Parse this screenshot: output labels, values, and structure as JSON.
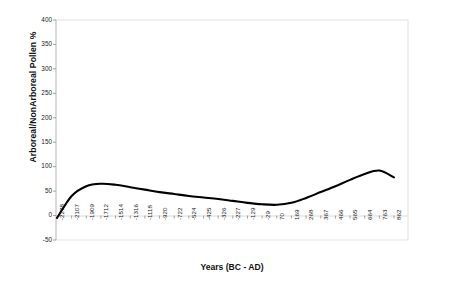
{
  "chart_data": {
    "type": "line",
    "title": "",
    "xlabel": "Years (BC - AD)",
    "ylabel": "Arboreal/NonArboreal Pollen %",
    "grid": false,
    "legend": null,
    "ylim": [
      -50,
      400
    ],
    "ytick_labels": [
      "400",
      "350",
      "300",
      "250",
      "200",
      "150",
      "100",
      "50",
      "0",
      "-50"
    ],
    "ytick_values": [
      400,
      350,
      300,
      250,
      200,
      150,
      100,
      50,
      0,
      -50
    ],
    "xtick_labels": [
      "-2278",
      "-2107",
      "-1909",
      "-1712",
      "-1514",
      "-1316",
      "-1118",
      "-920",
      "-722",
      "-524",
      "-425",
      "-326",
      "-227",
      "-129",
      "-29",
      "70",
      "169",
      "268",
      "367",
      "466",
      "565",
      "664",
      "763",
      "862"
    ],
    "categories": [
      -2278,
      -2107,
      -1909,
      -1712,
      -1514,
      -1316,
      -1118,
      -920,
      -722,
      -524,
      -425,
      -326,
      -227,
      -129,
      -29,
      70,
      169,
      268,
      367,
      466,
      565,
      664,
      763,
      862
    ],
    "series": [
      {
        "name": "Arboreal/NonArboreal Pollen %",
        "color": "#000000",
        "values": [
          -5,
          40,
          60,
          65,
          63,
          58,
          53,
          48,
          44,
          40,
          37,
          34,
          30,
          26,
          23,
          22,
          26,
          36,
          48,
          60,
          73,
          85,
          92,
          78
        ]
      }
    ]
  },
  "axes": {
    "y_title": "Arboreal/NonArboreal Pollen %",
    "x_title": "Years (BC - AD)"
  }
}
